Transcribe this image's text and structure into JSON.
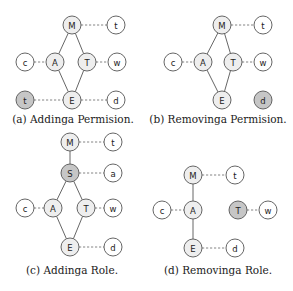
{
  "colors": {
    "plain": "#ffffff",
    "inner": "#eeeeee",
    "highlight": "#c6c6c6",
    "stroke": "#555555"
  },
  "node_radius": 9,
  "panels": [
    {
      "id": "a",
      "caption": "(a) Addinga Permision.",
      "caption_pos": [
        73,
        113
      ],
      "nodes": [
        {
          "id": "M",
          "label": "M",
          "x": 72,
          "y": 25,
          "fill": "inner"
        },
        {
          "id": "t",
          "label": "t",
          "x": 116,
          "y": 25,
          "fill": "plain"
        },
        {
          "id": "c",
          "label": "c",
          "x": 25,
          "y": 62,
          "fill": "plain"
        },
        {
          "id": "A",
          "label": "A",
          "x": 55,
          "y": 62,
          "fill": "inner"
        },
        {
          "id": "T",
          "label": "T",
          "x": 87,
          "y": 62,
          "fill": "inner"
        },
        {
          "id": "w",
          "label": "w",
          "x": 117,
          "y": 62,
          "fill": "plain"
        },
        {
          "id": "t2",
          "label": "t",
          "x": 25,
          "y": 100,
          "fill": "highlight"
        },
        {
          "id": "E",
          "label": "E",
          "x": 72,
          "y": 100,
          "fill": "inner"
        },
        {
          "id": "d",
          "label": "d",
          "x": 116,
          "y": 100,
          "fill": "plain"
        }
      ],
      "edges": [
        {
          "from": "M",
          "to": "A",
          "style": "solid"
        },
        {
          "from": "M",
          "to": "T",
          "style": "solid"
        },
        {
          "from": "A",
          "to": "E",
          "style": "solid"
        },
        {
          "from": "T",
          "to": "E",
          "style": "solid"
        },
        {
          "from": "M",
          "to": "t",
          "style": "dashed"
        },
        {
          "from": "c",
          "to": "A",
          "style": "dashed"
        },
        {
          "from": "T",
          "to": "w",
          "style": "dashed"
        },
        {
          "from": "t2",
          "to": "E",
          "style": "dashed"
        },
        {
          "from": "E",
          "to": "d",
          "style": "dashed"
        }
      ]
    },
    {
      "id": "b",
      "caption": "(b) Removinga Permision.",
      "caption_pos": [
        218,
        113
      ],
      "nodes": [
        {
          "id": "M",
          "label": "M",
          "x": 222,
          "y": 25,
          "fill": "inner"
        },
        {
          "id": "t",
          "label": "t",
          "x": 263,
          "y": 25,
          "fill": "plain"
        },
        {
          "id": "c",
          "label": "c",
          "x": 173,
          "y": 62,
          "fill": "plain"
        },
        {
          "id": "A",
          "label": "A",
          "x": 203,
          "y": 62,
          "fill": "inner"
        },
        {
          "id": "T",
          "label": "T",
          "x": 233,
          "y": 62,
          "fill": "inner"
        },
        {
          "id": "w",
          "label": "w",
          "x": 263,
          "y": 62,
          "fill": "plain"
        },
        {
          "id": "E",
          "label": "E",
          "x": 222,
          "y": 100,
          "fill": "inner"
        },
        {
          "id": "d",
          "label": "d",
          "x": 263,
          "y": 100,
          "fill": "highlight"
        }
      ],
      "edges": [
        {
          "from": "M",
          "to": "A",
          "style": "solid"
        },
        {
          "from": "M",
          "to": "T",
          "style": "solid"
        },
        {
          "from": "A",
          "to": "E",
          "style": "solid"
        },
        {
          "from": "T",
          "to": "E",
          "style": "solid"
        },
        {
          "from": "M",
          "to": "t",
          "style": "dashed"
        },
        {
          "from": "c",
          "to": "A",
          "style": "dashed"
        },
        {
          "from": "T",
          "to": "w",
          "style": "dashed"
        }
      ]
    },
    {
      "id": "c",
      "caption": "(c) Addinga Role.",
      "caption_pos": [
        72,
        264
      ],
      "nodes": [
        {
          "id": "M",
          "label": "M",
          "x": 70,
          "y": 142,
          "fill": "inner"
        },
        {
          "id": "t",
          "label": "t",
          "x": 113,
          "y": 142,
          "fill": "plain"
        },
        {
          "id": "S",
          "label": "S",
          "x": 70,
          "y": 173,
          "fill": "highlight"
        },
        {
          "id": "a",
          "label": "a",
          "x": 113,
          "y": 173,
          "fill": "plain"
        },
        {
          "id": "c",
          "label": "c",
          "x": 25,
          "y": 208,
          "fill": "plain"
        },
        {
          "id": "A",
          "label": "A",
          "x": 53,
          "y": 208,
          "fill": "inner"
        },
        {
          "id": "T",
          "label": "T",
          "x": 86,
          "y": 208,
          "fill": "inner"
        },
        {
          "id": "w",
          "label": "w",
          "x": 113,
          "y": 208,
          "fill": "plain"
        },
        {
          "id": "E",
          "label": "E",
          "x": 70,
          "y": 247,
          "fill": "inner"
        },
        {
          "id": "d",
          "label": "d",
          "x": 113,
          "y": 247,
          "fill": "plain"
        }
      ],
      "edges": [
        {
          "from": "M",
          "to": "S",
          "style": "solid"
        },
        {
          "from": "S",
          "to": "A",
          "style": "solid"
        },
        {
          "from": "S",
          "to": "T",
          "style": "solid"
        },
        {
          "from": "A",
          "to": "E",
          "style": "solid"
        },
        {
          "from": "T",
          "to": "E",
          "style": "solid"
        },
        {
          "from": "M",
          "to": "t",
          "style": "dashed"
        },
        {
          "from": "S",
          "to": "a",
          "style": "dashed"
        },
        {
          "from": "c",
          "to": "A",
          "style": "dashed"
        },
        {
          "from": "T",
          "to": "w",
          "style": "dashed"
        },
        {
          "from": "E",
          "to": "d",
          "style": "dashed"
        }
      ]
    },
    {
      "id": "d",
      "caption": "(d) Removinga Role.",
      "caption_pos": [
        218,
        264
      ],
      "nodes": [
        {
          "id": "M",
          "label": "M",
          "x": 193,
          "y": 175,
          "fill": "inner"
        },
        {
          "id": "t",
          "label": "t",
          "x": 235,
          "y": 175,
          "fill": "plain"
        },
        {
          "id": "c",
          "label": "c",
          "x": 162,
          "y": 210,
          "fill": "plain"
        },
        {
          "id": "A",
          "label": "A",
          "x": 193,
          "y": 210,
          "fill": "inner"
        },
        {
          "id": "T",
          "label": "T",
          "x": 238,
          "y": 210,
          "fill": "highlight"
        },
        {
          "id": "w",
          "label": "w",
          "x": 268,
          "y": 210,
          "fill": "plain"
        },
        {
          "id": "E",
          "label": "E",
          "x": 193,
          "y": 248,
          "fill": "inner"
        },
        {
          "id": "d",
          "label": "d",
          "x": 235,
          "y": 248,
          "fill": "plain"
        }
      ],
      "edges": [
        {
          "from": "M",
          "to": "A",
          "style": "solid"
        },
        {
          "from": "A",
          "to": "E",
          "style": "solid"
        },
        {
          "from": "M",
          "to": "t",
          "style": "dashed"
        },
        {
          "from": "c",
          "to": "A",
          "style": "dashed"
        },
        {
          "from": "T",
          "to": "w",
          "style": "dashed"
        },
        {
          "from": "E",
          "to": "d",
          "style": "dashed"
        }
      ]
    }
  ]
}
